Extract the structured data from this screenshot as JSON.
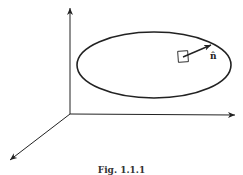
{
  "figure": {
    "caption": "Fig. 1.1.1",
    "normal_label": "n̂",
    "colors": {
      "stroke": "#222222",
      "background": "#ffffff"
    },
    "axes": {
      "origin": [
        70,
        114
      ],
      "z_end": [
        70,
        8
      ],
      "x_end": [
        235,
        115
      ],
      "y_end": [
        10,
        160
      ]
    },
    "surface": {
      "shape": "ellipse",
      "cx": 154,
      "cy": 65,
      "rx": 77,
      "ry": 33
    },
    "surface_element": {
      "x": 178,
      "y": 51,
      "w": 10,
      "h": 11
    },
    "normal_vector": {
      "from": [
        183,
        57
      ],
      "to": [
        211,
        45
      ]
    }
  }
}
